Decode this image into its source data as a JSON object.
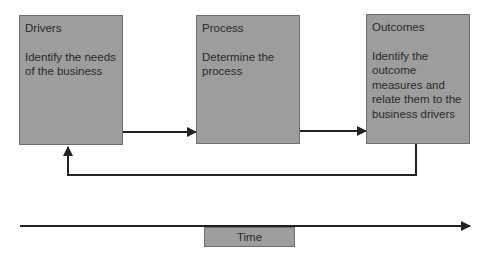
{
  "diagram": {
    "type": "flow",
    "colors": {
      "box_fill": "#9d9d9d",
      "box_border": "#6e6e6e",
      "line": "#222222",
      "text": "#2a2a2a"
    },
    "boxes": [
      {
        "id": "drivers",
        "title": "Drivers",
        "description": "Identify the needs of the business"
      },
      {
        "id": "process",
        "title": "Process",
        "description": "Determine the process"
      },
      {
        "id": "outcomes",
        "title": "Outcomes",
        "description": "Identify the outcome measures and relate them to the business drivers"
      }
    ],
    "edges": [
      {
        "from": "drivers",
        "to": "process"
      },
      {
        "from": "process",
        "to": "outcomes"
      },
      {
        "from": "outcomes",
        "to": "drivers",
        "kind": "feedback-loop"
      }
    ],
    "time_axis": {
      "label": "Time",
      "direction": "left-to-right"
    }
  }
}
